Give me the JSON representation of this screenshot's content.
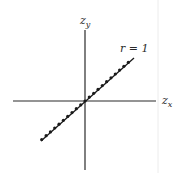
{
  "diagram": {
    "type": "scatter-axes",
    "axes": {
      "x_label": "z",
      "x_sub": "x",
      "y_label": "z",
      "y_sub": "y"
    },
    "annotation": "r = 1",
    "colors": {
      "axis": "#2a2a2a",
      "points": "#1a1a1a",
      "edge_line": "#e4e4e4"
    }
  },
  "chart_data": {
    "type": "scatter",
    "title": "",
    "xlabel": "z_x",
    "ylabel": "z_y",
    "annotation": "r = 1",
    "points": [
      [
        -2.0,
        -2.0
      ],
      [
        -1.8,
        -1.8
      ],
      [
        -1.6,
        -1.6
      ],
      [
        -1.4,
        -1.4
      ],
      [
        -1.2,
        -1.2
      ],
      [
        -1.0,
        -1.0
      ],
      [
        -0.8,
        -0.8
      ],
      [
        -0.6,
        -0.6
      ],
      [
        -0.4,
        -0.4
      ],
      [
        -0.2,
        -0.2
      ],
      [
        0.0,
        0.0
      ],
      [
        0.2,
        0.2
      ],
      [
        0.4,
        0.4
      ],
      [
        0.6,
        0.6
      ],
      [
        0.8,
        0.8
      ],
      [
        1.0,
        1.0
      ],
      [
        1.2,
        1.2
      ],
      [
        1.4,
        1.4
      ],
      [
        1.6,
        1.6
      ],
      [
        1.8,
        1.8
      ],
      [
        2.0,
        2.0
      ]
    ],
    "grid": false,
    "legend": "none"
  }
}
